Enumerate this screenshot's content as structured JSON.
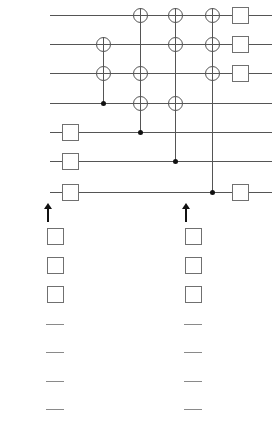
{
  "figure": {
    "width": 275,
    "height": 446,
    "wire_color": "#555555",
    "gate_border_color": "#707070",
    "control_color": "#111111"
  },
  "qubits": [
    {
      "index": "6",
      "state": "|0⟩",
      "y": 15
    },
    {
      "index": "5",
      "state": "|0⟩",
      "y": 44
    },
    {
      "index": "4",
      "state": "|0⟩",
      "y": 73
    },
    {
      "index": "3",
      "state": "|ψ⟩",
      "y": 103
    },
    {
      "index": "2",
      "state": "|0⟩",
      "y": 132
    },
    {
      "index": "1",
      "state": "|0⟩",
      "y": 161
    },
    {
      "index": "0",
      "state": "|0⟩",
      "y": 192
    }
  ],
  "hadamard_gates": [
    {
      "label": "H",
      "qubit": "2",
      "x": 70,
      "y": 132
    },
    {
      "label": "H",
      "qubit": "1",
      "x": 70,
      "y": 161
    },
    {
      "label": "H",
      "qubit": "0",
      "x": 70,
      "y": 192
    }
  ],
  "cnot_columns": [
    {
      "x": 103,
      "control_qubit": "3",
      "control_y": 103,
      "target_qubits": [
        "5",
        "4"
      ],
      "target_ys": [
        44,
        73
      ]
    },
    {
      "x": 140,
      "control_qubit": "2",
      "control_y": 132,
      "target_qubits": [
        "6",
        "4",
        "3"
      ],
      "target_ys": [
        15,
        73,
        103
      ]
    },
    {
      "x": 175,
      "control_qubit": "1",
      "control_y": 161,
      "target_qubits": [
        "6",
        "5",
        "3"
      ],
      "target_ys": [
        15,
        44,
        103
      ]
    },
    {
      "x": 212,
      "control_qubit": "0",
      "control_y": 192,
      "target_qubits": [
        "6",
        "5",
        "4"
      ],
      "target_ys": [
        15,
        44,
        73
      ]
    }
  ],
  "z_gates": [
    {
      "label": "Z",
      "qubit": "6",
      "x": 240,
      "y": 15
    },
    {
      "label": "Z",
      "qubit": "5",
      "x": 240,
      "y": 44
    },
    {
      "label": "Z",
      "qubit": "4",
      "x": 240,
      "y": 73
    },
    {
      "label": "Z",
      "qubit": "0",
      "x": 240,
      "y": 192
    }
  ],
  "arrows": [
    {
      "name": "left-arrow",
      "x": 48,
      "y_tip": 203,
      "y_base": 222
    },
    {
      "name": "right-arrow",
      "x": 186,
      "y_tip": 203,
      "y_base": 222
    }
  ],
  "panels": [
    {
      "caption": "(b)",
      "x": 55,
      "caption_y": 425,
      "z_gates": [
        {
          "label": "Z",
          "y": 236
        },
        {
          "label": "Z",
          "y": 265
        },
        {
          "label": "Z",
          "y": 294
        }
      ],
      "dashes": [
        {
          "y": 324
        },
        {
          "y": 352
        },
        {
          "y": 381
        },
        {
          "y": 409
        }
      ]
    },
    {
      "caption": "(a)",
      "x": 193,
      "caption_y": 425,
      "z_gates": [
        {
          "label": "Z",
          "y": 236
        },
        {
          "label": "Z",
          "y": 265
        },
        {
          "label": "Z",
          "y": 294
        }
      ],
      "dashes": [
        {
          "y": 324
        },
        {
          "y": 352
        },
        {
          "y": 381
        },
        {
          "y": 409
        }
      ]
    }
  ]
}
